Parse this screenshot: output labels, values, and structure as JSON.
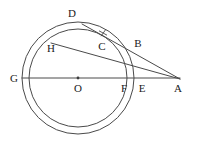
{
  "figure": {
    "type": "geometry-diagram",
    "width": 198,
    "height": 151,
    "background_color": "#ffffff",
    "stroke_color": "#3c3c3c",
    "label_color": "#1a1a1a"
  },
  "circles": [
    {
      "name": "outer-circle",
      "center": {
        "x": 78,
        "y": 78
      },
      "radius": 56,
      "stroke": "#4a4a4a",
      "stroke_width": 1
    },
    {
      "name": "inner-circle",
      "center": {
        "x": 78,
        "y": 78
      },
      "radius": 49,
      "stroke": "#4a4a4a",
      "stroke_width": 1
    }
  ],
  "center_point": {
    "name": "O",
    "x": 78,
    "y": 78,
    "radius": 1.4
  },
  "lines": [
    {
      "name": "diameter-line-GA",
      "from": {
        "x": 22,
        "y": 78
      },
      "to": {
        "x": 180,
        "y": 78
      },
      "stroke": "#4a4a4a",
      "stroke_width": 1
    },
    {
      "name": "secant-line-DCBA",
      "from": {
        "x": 82,
        "y": 24
      },
      "to": {
        "x": 180,
        "y": 79
      },
      "stroke": "#4a4a4a",
      "stroke_width": 1
    },
    {
      "name": "chord-line-HF",
      "from": {
        "x": 51,
        "y": 43
      },
      "to": {
        "x": 180,
        "y": 79
      },
      "stroke": "#4a4a4a",
      "stroke_width": 1
    }
  ],
  "tick_marks": [
    {
      "name": "tick-mark-near-C",
      "x": 103,
      "y": 33,
      "size": 4,
      "stroke": "#4a4a4a"
    }
  ],
  "points": [
    {
      "id": "D",
      "label": "D",
      "point": {
        "x": 82,
        "y": 24
      },
      "label_pos": {
        "x": 72,
        "y": 13
      },
      "on": "outer-circle"
    },
    {
      "id": "C",
      "label": "C",
      "point": {
        "x": 105,
        "y": 39
      },
      "label_pos": {
        "x": 102,
        "y": 46
      },
      "on": "inner-circle"
    },
    {
      "id": "B",
      "label": "B",
      "point": {
        "x": 131,
        "y": 46
      },
      "label_pos": {
        "x": 138,
        "y": 43
      },
      "on": "outer-circle"
    },
    {
      "id": "H",
      "label": "H",
      "point": {
        "x": 51,
        "y": 43
      },
      "label_pos": {
        "x": 51,
        "y": 48
      },
      "on": "inner-circle"
    },
    {
      "id": "G",
      "label": "G",
      "point": {
        "x": 29,
        "y": 78
      },
      "label_pos": {
        "x": 14,
        "y": 78
      },
      "on": "inner-circle"
    },
    {
      "id": "O",
      "label": "O",
      "point": {
        "x": 78,
        "y": 78
      },
      "label_pos": {
        "x": 78,
        "y": 88
      },
      "on": "center"
    },
    {
      "id": "F",
      "label": "F",
      "point": {
        "x": 127,
        "y": 78
      },
      "label_pos": {
        "x": 124,
        "y": 88
      },
      "on": "inner-circle"
    },
    {
      "id": "E",
      "label": "E",
      "point": {
        "x": 134,
        "y": 78
      },
      "label_pos": {
        "x": 142,
        "y": 88
      },
      "on": "outer-circle"
    },
    {
      "id": "A",
      "label": "A",
      "point": {
        "x": 179,
        "y": 78
      },
      "label_pos": {
        "x": 178,
        "y": 88
      },
      "on": "exterior"
    }
  ]
}
